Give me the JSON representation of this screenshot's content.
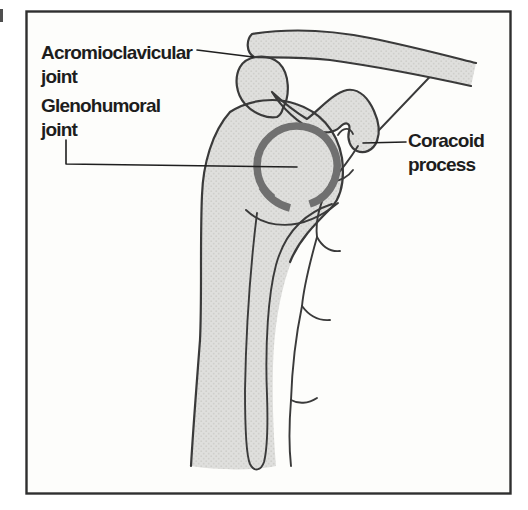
{
  "figure": {
    "labels": {
      "acromioclavicular": {
        "line1": "Acromioclavicular",
        "line2": "joint"
      },
      "glenohumoral": {
        "line1": "Glenohumoral",
        "line2": "joint"
      },
      "coracoid": {
        "line1": "Coracoid",
        "line2": "process"
      }
    },
    "colors": {
      "bone_fill": "#dfdfdd",
      "outline": "#3a3a3a",
      "capsule_ring": "#707070",
      "leader_line": "#1f1f1f",
      "frame": "#2f2f2f",
      "paper": "#fdfdfb",
      "text": "#1d1d1d"
    }
  }
}
